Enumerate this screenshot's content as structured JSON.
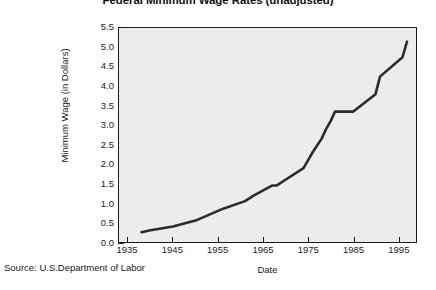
{
  "chart_data": {
    "type": "line",
    "title": "Federal Minimum Wage Rates (unadjusted)",
    "xlabel": "Date",
    "ylabel": "Minimum Wage (in Dollars)",
    "xlim": [
      1933,
      1999
    ],
    "ylim": [
      0.0,
      5.5
    ],
    "grid": false,
    "legend": "none",
    "source_note": "Source: U.S.Department of Labor",
    "x_ticks": [
      1935,
      1945,
      1955,
      1965,
      1975,
      1985,
      1995
    ],
    "x_tick_labels": [
      "1935",
      "1945",
      "1955",
      "1965",
      "1975",
      "1985",
      "1995"
    ],
    "y_ticks": [
      0.0,
      0.5,
      1.0,
      1.5,
      2.0,
      2.5,
      3.0,
      3.5,
      4.0,
      4.5,
      5.0,
      5.5
    ],
    "y_tick_labels": [
      "0.0",
      "0.5",
      "1.0",
      "1.5",
      "2.0",
      "2.5",
      "3.0",
      "3.5",
      "4.0",
      "4.5",
      "5.0",
      "5.5"
    ],
    "series": [
      {
        "name": "Federal minimum wage (nominal dollars)",
        "color": "#2b2b2b",
        "x": [
          1938,
          1940,
          1945,
          1950,
          1956,
          1961,
          1963,
          1967,
          1968,
          1970,
          1974,
          1975,
          1976,
          1978,
          1979,
          1980,
          1981,
          1985,
          1990,
          1991,
          1996,
          1997
        ],
        "y": [
          0.25,
          0.3,
          0.4,
          0.55,
          0.85,
          1.05,
          1.2,
          1.45,
          1.45,
          1.6,
          1.9,
          2.1,
          2.3,
          2.65,
          2.9,
          3.1,
          3.35,
          3.35,
          3.8,
          4.25,
          4.75,
          5.15
        ]
      }
    ]
  },
  "figure": {
    "background_color": "#ffffff",
    "plot_background_color": "#ececec",
    "axis_color": "#1b1b1b"
  }
}
